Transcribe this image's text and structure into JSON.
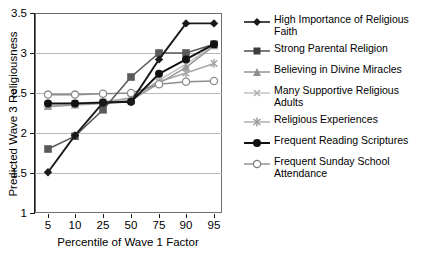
{
  "chart_data": {
    "type": "line",
    "title": "",
    "xlabel": "Percentile of Wave 1 Factor",
    "ylabel": "Predicted Wave 3 Religiousness",
    "categories": [
      "5",
      "10",
      "25",
      "50",
      "75",
      "90",
      "95"
    ],
    "ylim": [
      1,
      3.5
    ],
    "yticks": [
      "1",
      "1.5",
      "2",
      "2.5",
      "3",
      "3.5"
    ],
    "ytick_values": [
      1,
      1.5,
      2,
      2.5,
      3,
      3.5
    ],
    "grid": "horizontal",
    "legend_position": "right",
    "series": [
      {
        "name": "High Importance of Religious Faith",
        "marker": "diamond",
        "color": "#1a1a1a",
        "values": [
          1.51,
          1.97,
          2.38,
          2.39,
          2.92,
          3.37,
          3.37
        ]
      },
      {
        "name": "Strong Parental Religion",
        "marker": "square",
        "color": "#5a5a5a",
        "values": [
          1.8,
          1.96,
          2.29,
          2.7,
          3.0,
          3.0,
          3.11
        ]
      },
      {
        "name": "Believing in Divine Miracles",
        "marker": "triangle",
        "color": "#9a9a9a",
        "values": [
          2.33,
          2.35,
          2.37,
          2.41,
          2.62,
          2.82,
          3.09
        ]
      },
      {
        "name": "Many Supportive Religious Adults",
        "marker": "x",
        "color": "#c2c2c2",
        "values": [
          2.36,
          2.37,
          2.39,
          2.43,
          2.66,
          2.86,
          3.1
        ]
      },
      {
        "name": "Religious Experiences",
        "marker": "asterisk",
        "color": "#a8a8a8",
        "values": [
          2.35,
          2.36,
          2.38,
          2.44,
          2.64,
          2.75,
          2.87
        ]
      },
      {
        "name": "Frequent Reading Scriptures",
        "marker": "filled-circle",
        "color": "#111111",
        "values": [
          2.37,
          2.37,
          2.38,
          2.39,
          2.74,
          2.92,
          3.11
        ]
      },
      {
        "name": "Frequent Sunday School Attendance",
        "marker": "open-circle",
        "color": "#8c8c8c",
        "values": [
          2.48,
          2.48,
          2.49,
          2.5,
          2.61,
          2.64,
          2.65
        ]
      }
    ]
  },
  "legend": {
    "items": [
      {
        "label": "High Importance of Religious Faith"
      },
      {
        "label": "Strong Parental Religion"
      },
      {
        "label": "Believing in Divine Miracles"
      },
      {
        "label": "Many Supportive Religious Adults"
      },
      {
        "label": "Religious Experiences"
      },
      {
        "label": "Frequent Reading Scriptures"
      },
      {
        "label": "Frequent Sunday School Attendance"
      }
    ]
  },
  "axes": {
    "y_title": "Predicted Wave 3 Religiousness",
    "x_title": "Percentile of Wave 1 Factor",
    "y_labels": [
      "3.5",
      "3",
      "2.5",
      "2",
      "1.5",
      "1"
    ],
    "x_labels": [
      "5",
      "10",
      "25",
      "50",
      "75",
      "90",
      "95"
    ]
  }
}
